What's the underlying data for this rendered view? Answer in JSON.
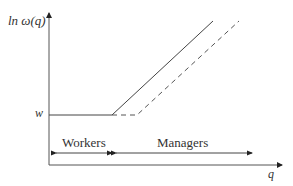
{
  "diagram": {
    "y_axis_label": "ln ω(q)",
    "x_axis_label": "q",
    "w_label": "w",
    "regions": [
      {
        "label": "Workers"
      },
      {
        "label": "Managers"
      }
    ],
    "lines": [
      {
        "style": "solid",
        "description": "flat at w until kink, then rising"
      },
      {
        "style": "dashed",
        "description": "flat at w until later kink, then rising parallel"
      }
    ],
    "colors": {
      "line": "#444444",
      "text": "#333333"
    }
  }
}
